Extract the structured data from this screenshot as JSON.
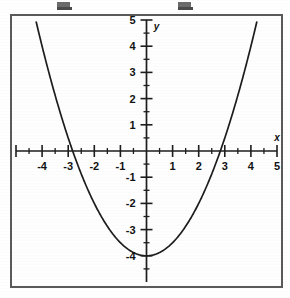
{
  "figure": {
    "kind": "cartesian-plot",
    "background_color": "#fefefe",
    "border_color": "#5a5a5a",
    "ink_color": "#1d1d1d"
  },
  "top_artifacts": {
    "present": true,
    "count": 2,
    "note": "faint cropped glyph fragments along the very top edge"
  },
  "chart_data": {
    "type": "line",
    "title": "",
    "subtitle": "",
    "xlabel": "x",
    "ylabel": "y",
    "xlim": [
      -5,
      5
    ],
    "ylim": [
      -5,
      5
    ],
    "grid": false,
    "legend": null,
    "axis_style": "centered-cross",
    "x_major_ticks": [
      -5,
      -4,
      -3,
      -2,
      -1,
      0,
      1,
      2,
      3,
      4,
      5
    ],
    "y_major_ticks": [
      -4,
      -3,
      -2,
      -1,
      0,
      1,
      2,
      3,
      4,
      5
    ],
    "x_tick_labels": [
      "-4",
      "-3",
      "-2",
      "-1",
      "1",
      "2",
      "3",
      "4",
      "5"
    ],
    "y_tick_labels": [
      "5",
      "4",
      "3",
      "2",
      "1",
      "-1",
      "-2",
      "-3",
      "-4"
    ],
    "minor_tick_interval": 0.5,
    "series": [
      {
        "name": "parabola",
        "equation": "y = x^2/2 - 4",
        "vertex": [
          0,
          -4
        ],
        "x_intercepts": [
          -2.83,
          2.83
        ],
        "y_intercept": -4,
        "x": [
          -4.25,
          -4.0,
          -3.5,
          -3.0,
          -2.83,
          -2.5,
          -2.0,
          -1.5,
          -1.0,
          -0.5,
          0.0,
          0.5,
          1.0,
          1.5,
          2.0,
          2.5,
          2.83,
          3.0,
          3.5,
          4.0,
          4.25
        ],
        "values": [
          5.03,
          4.0,
          2.13,
          0.5,
          0.0,
          -0.88,
          -2.0,
          -2.88,
          -3.5,
          -3.88,
          -4.0,
          -3.88,
          -3.5,
          -2.88,
          -2.0,
          -0.88,
          0.0,
          0.5,
          2.13,
          4.0,
          5.03
        ]
      }
    ]
  },
  "axis_labels": {
    "x_axis_name": "x",
    "y_axis_name": "y"
  }
}
